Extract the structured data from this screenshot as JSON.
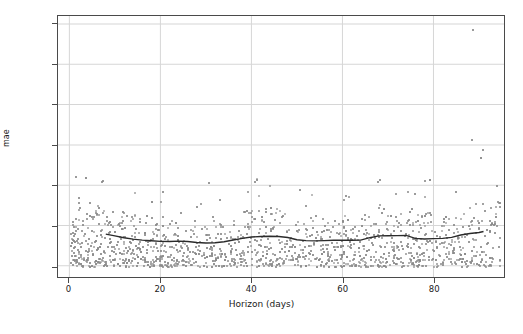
{
  "chart_data": {
    "type": "scatter",
    "title": "",
    "xlabel": "Horizon (days)",
    "ylabel": "mae",
    "xlim": [
      -2.5,
      95.5
    ],
    "ylim": [
      -140,
      3100
    ],
    "xticks": [
      0,
      20,
      40,
      60,
      80
    ],
    "yticks": [
      0,
      500,
      1000,
      1500,
      2000,
      2500,
      3000
    ],
    "grid": true,
    "legend": "none",
    "marker_color": "#8a8a8a",
    "trend_color": "#2b2b2b",
    "axis_color": "#4a4a4a",
    "grid_color": "#d6d6d6",
    "background": "#ffffff",
    "series": [
      {
        "name": "cross-validation mae",
        "marker": "square",
        "points": [
          [
            0.4,
            62
          ],
          [
            0.5,
            140
          ],
          [
            0.6,
            305
          ],
          [
            0.7,
            421
          ],
          [
            0.8,
            28
          ],
          [
            0.9,
            505
          ],
          [
            1.0,
            180
          ],
          [
            1.1,
            392
          ],
          [
            1.2,
            78
          ],
          [
            1.3,
            250
          ],
          [
            1.4,
            600
          ],
          [
            1.5,
            1115
          ],
          [
            1.6,
            330
          ],
          [
            1.7,
            95
          ],
          [
            1.8,
            470
          ],
          [
            1.9,
            215
          ],
          [
            2.0,
            860
          ],
          [
            2.2,
            45
          ],
          [
            2.4,
            740
          ],
          [
            2.6,
            150
          ],
          [
            2.8,
            300
          ],
          [
            3.0,
            520
          ],
          [
            3.2,
            90
          ],
          [
            3.4,
            410
          ],
          [
            3.6,
            205
          ],
          [
            3.8,
            660
          ],
          [
            4.0,
            120
          ],
          [
            4.2,
            350
          ],
          [
            4.4,
            800
          ],
          [
            4.6,
            60
          ],
          [
            4.8,
            270
          ],
          [
            5.0,
            450
          ],
          [
            5.2,
            165
          ],
          [
            5.4,
            620
          ],
          [
            5.6,
            310
          ],
          [
            5.8,
            85
          ],
          [
            6.0,
            390
          ],
          [
            6.2,
            230
          ],
          [
            6.4,
            540
          ],
          [
            6.6,
            110
          ],
          [
            6.8,
            450
          ],
          [
            7.0,
            290
          ],
          [
            7.2,
            1060
          ],
          [
            7.4,
            1070
          ],
          [
            7.6,
            190
          ],
          [
            7.8,
            370
          ],
          [
            8.0,
            70
          ],
          [
            8.2,
            620
          ],
          [
            8.4,
            255
          ],
          [
            8.6,
            430
          ],
          [
            8.8,
            140
          ],
          [
            9.0,
            520
          ],
          [
            9.2,
            320
          ],
          [
            9.4,
            200
          ],
          [
            9.6,
            690
          ],
          [
            9.8,
            95
          ],
          [
            10.0,
            440
          ],
          [
            10.5,
            275
          ],
          [
            11.0,
            510
          ],
          [
            11.5,
            170
          ],
          [
            12.0,
            380
          ],
          [
            12.5,
            640
          ],
          [
            13.0,
            90
          ],
          [
            13.5,
            300
          ],
          [
            14.0,
            220
          ],
          [
            14.5,
            470
          ],
          [
            15.0,
            130
          ],
          [
            15.5,
            560
          ],
          [
            16.0,
            250
          ],
          [
            16.5,
            400
          ],
          [
            17.0,
            180
          ],
          [
            17.5,
            330
          ],
          [
            18.0,
            610
          ],
          [
            18.5,
            75
          ],
          [
            19.0,
            290
          ],
          [
            19.5,
            460
          ],
          [
            20.0,
            210
          ],
          [
            20.5,
            930
          ],
          [
            21.0,
            350
          ],
          [
            21.5,
            130
          ],
          [
            22.0,
            540
          ],
          [
            22.5,
            260
          ],
          [
            23.0,
            420
          ],
          [
            23.5,
            95
          ],
          [
            24.0,
            310
          ],
          [
            24.5,
            670
          ],
          [
            25.0,
            185
          ],
          [
            25.5,
            450
          ],
          [
            26.0,
            240
          ],
          [
            26.5,
            380
          ],
          [
            27.0,
            110
          ],
          [
            27.5,
            570
          ],
          [
            28.0,
            300
          ],
          [
            28.5,
            200
          ],
          [
            29.0,
            480
          ],
          [
            29.5,
            150
          ],
          [
            30.0,
            340
          ],
          [
            30.5,
            1040
          ],
          [
            31.0,
            260
          ],
          [
            31.5,
            620
          ],
          [
            32.0,
            105
          ],
          [
            32.5,
            410
          ],
          [
            33.0,
            230
          ],
          [
            33.5,
            500
          ],
          [
            34.0,
            170
          ],
          [
            34.5,
            360
          ],
          [
            35.0,
            290
          ],
          [
            35.5,
            80
          ],
          [
            36.0,
            530
          ],
          [
            36.5,
            220
          ],
          [
            37.0,
            450
          ],
          [
            37.5,
            140
          ],
          [
            38.0,
            380
          ],
          [
            38.5,
            680
          ],
          [
            39.0,
            250
          ],
          [
            39.5,
            320
          ],
          [
            40.0,
            190
          ],
          [
            40.5,
            1050
          ],
          [
            41.0,
            1085
          ],
          [
            41.5,
            430
          ],
          [
            42.0,
            270
          ],
          [
            42.5,
            560
          ],
          [
            43.0,
            115
          ],
          [
            43.5,
            350
          ],
          [
            44.0,
            240
          ],
          [
            44.5,
            490
          ],
          [
            45.0,
            160
          ],
          [
            45.5,
            390
          ],
          [
            46.0,
            300
          ],
          [
            46.5,
            620
          ],
          [
            47.0,
            85
          ],
          [
            47.5,
            440
          ],
          [
            48.0,
            210
          ],
          [
            48.5,
            370
          ],
          [
            49.0,
            280
          ],
          [
            49.5,
            520
          ],
          [
            50.0,
            125
          ],
          [
            50.5,
            960
          ],
          [
            51.0,
            330
          ],
          [
            51.5,
            250
          ],
          [
            52.0,
            460
          ],
          [
            52.5,
            175
          ],
          [
            53.0,
            400
          ],
          [
            53.5,
            290
          ],
          [
            54.0,
            640
          ],
          [
            54.5,
            100
          ],
          [
            55.0,
            350
          ],
          [
            55.5,
            230
          ],
          [
            56.0,
            510
          ],
          [
            56.5,
            165
          ],
          [
            57.0,
            380
          ],
          [
            57.5,
            300
          ],
          [
            58.0,
            580
          ],
          [
            58.5,
            95
          ],
          [
            59.0,
            420
          ],
          [
            59.5,
            265
          ],
          [
            60.0,
            190
          ],
          [
            60.5,
            880
          ],
          [
            61.0,
            340
          ],
          [
            61.5,
            240
          ],
          [
            62.0,
            470
          ],
          [
            62.5,
            150
          ],
          [
            63.0,
            390
          ],
          [
            63.5,
            310
          ],
          [
            64.0,
            600
          ],
          [
            64.5,
            120
          ],
          [
            65.0,
            430
          ],
          [
            65.5,
            220
          ],
          [
            66.0,
            360
          ],
          [
            66.5,
            280
          ],
          [
            67.0,
            540
          ],
          [
            67.5,
            1060
          ],
          [
            68.0,
            1080
          ],
          [
            68.5,
            400
          ],
          [
            69.0,
            250
          ],
          [
            69.5,
            480
          ],
          [
            70.0,
            175
          ],
          [
            70.5,
            370
          ],
          [
            71.0,
            300
          ],
          [
            71.5,
            620
          ],
          [
            72.0,
            110
          ],
          [
            72.5,
            450
          ],
          [
            73.0,
            230
          ],
          [
            73.5,
            390
          ],
          [
            74.0,
            290
          ],
          [
            74.5,
            530
          ],
          [
            75.0,
            145
          ],
          [
            75.5,
            910
          ],
          [
            76.0,
            350
          ],
          [
            76.5,
            260
          ],
          [
            77.0,
            490
          ],
          [
            77.5,
            185
          ],
          [
            78.0,
            410
          ],
          [
            78.5,
            320
          ],
          [
            79.0,
            650
          ],
          [
            79.5,
            105
          ],
          [
            80.0,
            440
          ],
          [
            80.5,
            240
          ],
          [
            81.0,
            380
          ],
          [
            81.5,
            300
          ],
          [
            82.0,
            560
          ],
          [
            82.5,
            130
          ],
          [
            83.0,
            460
          ],
          [
            83.5,
            275
          ],
          [
            84.0,
            200
          ],
          [
            84.5,
            930
          ],
          [
            85.0,
            360
          ],
          [
            85.5,
            250
          ],
          [
            86.0,
            500
          ],
          [
            86.5,
            170
          ],
          [
            87.0,
            400
          ],
          [
            87.5,
            320
          ],
          [
            88.0,
            1570
          ],
          [
            88.2,
            2930
          ],
          [
            88.5,
            610
          ],
          [
            89.0,
            140
          ],
          [
            89.5,
            470
          ],
          [
            90.0,
            250
          ],
          [
            90.5,
            1450
          ],
          [
            91.0,
            390
          ],
          [
            91.5,
            300
          ],
          [
            92.0,
            580
          ],
          [
            92.5,
            115
          ],
          [
            93.0,
            430
          ],
          [
            93.5,
            1010
          ],
          [
            94.0,
            260
          ]
        ]
      }
    ],
    "trend": {
      "name": "rolling mean mae",
      "color": "#2b2b2b",
      "points": [
        [
          8,
          392
        ],
        [
          10,
          370
        ],
        [
          12,
          347
        ],
        [
          14,
          330
        ],
        [
          16,
          318
        ],
        [
          18,
          310
        ],
        [
          20,
          302
        ],
        [
          22,
          300
        ],
        [
          24,
          305
        ],
        [
          26,
          300
        ],
        [
          28,
          288
        ],
        [
          30,
          282
        ],
        [
          32,
          285
        ],
        [
          34,
          298
        ],
        [
          36,
          320
        ],
        [
          38,
          340
        ],
        [
          40,
          356
        ],
        [
          42,
          362
        ],
        [
          44,
          366
        ],
        [
          46,
          362
        ],
        [
          48,
          350
        ],
        [
          50,
          322
        ],
        [
          52,
          312
        ],
        [
          54,
          308
        ],
        [
          56,
          312
        ],
        [
          58,
          316
        ],
        [
          60,
          318
        ],
        [
          62,
          316
        ],
        [
          64,
          318
        ],
        [
          66,
          348
        ],
        [
          68,
          370
        ],
        [
          70,
          372
        ],
        [
          72,
          374
        ],
        [
          74,
          376
        ],
        [
          76,
          340
        ],
        [
          78,
          332
        ],
        [
          80,
          336
        ],
        [
          82,
          340
        ],
        [
          84,
          352
        ],
        [
          86,
          382
        ],
        [
          88,
          400
        ],
        [
          90,
          412
        ],
        [
          91,
          425
        ]
      ]
    }
  }
}
